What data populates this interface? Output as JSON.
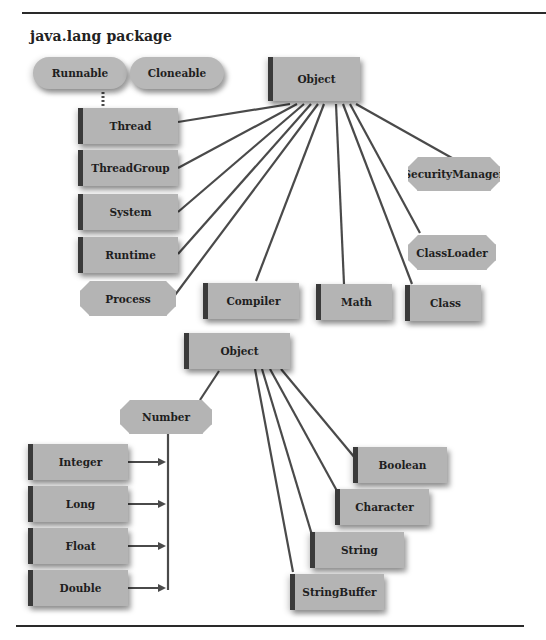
{
  "title": "java.lang package",
  "colors": {
    "node_fill": "#b4b4b4",
    "line": "#4a4a4a",
    "text": "#1e1e1e"
  },
  "diagram1": {
    "root": "Object",
    "interfaces": [
      "Runnable",
      "Cloneable"
    ],
    "nodes": {
      "thread": "Thread",
      "threadgroup": "ThreadGroup",
      "system": "System",
      "runtime": "Runtime",
      "process": "Process",
      "compiler": "Compiler",
      "math": "Math",
      "class": "Class",
      "classloader": "ClassLoader",
      "securitymanager": "SecurityManager"
    }
  },
  "diagram2": {
    "root": "Object",
    "nodes": {
      "number": "Number",
      "integer": "Integer",
      "long": "Long",
      "float": "Float",
      "double": "Double",
      "boolean": "Boolean",
      "character": "Character",
      "string": "String",
      "stringbuffer": "StringBuffer"
    }
  }
}
